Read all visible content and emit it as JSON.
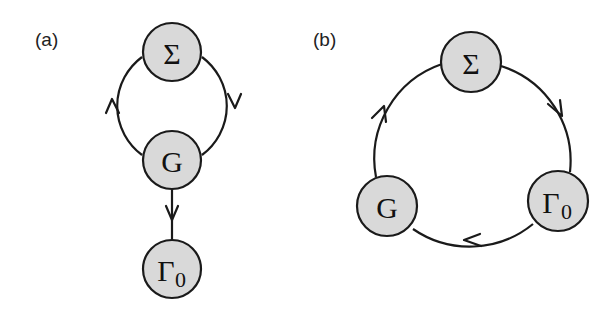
{
  "panels": [
    {
      "label": "(a)",
      "nodes": [
        {
          "id": "sigma",
          "symbol": "Σ",
          "subscript": ""
        },
        {
          "id": "G",
          "symbol": "G",
          "subscript": ""
        },
        {
          "id": "gamma0",
          "symbol": "Γ",
          "subscript": "0"
        }
      ],
      "edges": [
        {
          "from": "Σ",
          "to": "G",
          "side": "right",
          "direction": "down"
        },
        {
          "from": "G",
          "to": "Σ",
          "side": "left",
          "direction": "up"
        },
        {
          "from": "G",
          "to": "Γ0",
          "direction": "down"
        }
      ]
    },
    {
      "label": "(b)",
      "nodes": [
        {
          "id": "sigma",
          "symbol": "Σ",
          "subscript": ""
        },
        {
          "id": "G",
          "symbol": "G",
          "subscript": ""
        },
        {
          "id": "gamma0",
          "symbol": "Γ",
          "subscript": "0"
        }
      ],
      "edges": [
        {
          "from": "Σ",
          "to": "Γ0",
          "direction": "clockwise"
        },
        {
          "from": "Γ0",
          "to": "G",
          "direction": "clockwise"
        },
        {
          "from": "G",
          "to": "Σ",
          "direction": "clockwise"
        }
      ]
    }
  ],
  "colors": {
    "node_fill": "#d9d9d9",
    "stroke": "#1a1a1a",
    "background": "#ffffff"
  }
}
